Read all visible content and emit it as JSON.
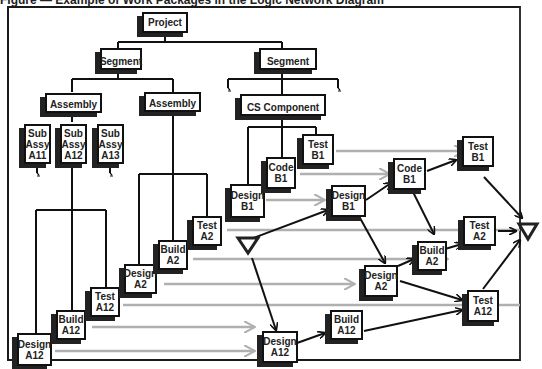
{
  "title": "Figure — Example of Work Packages in the Logic Network Diagram",
  "colors": {
    "box_border": "#111111",
    "shadow": "#222222",
    "logic_arrow": "#111111",
    "time_arrow": "#b0b0b0"
  },
  "wbs_tree": {
    "project": "Project",
    "segments": [
      "Segment",
      "Segment"
    ],
    "assemblies": [
      "Assembly",
      "Assembly"
    ],
    "cs_component": "CS Component",
    "sub_assemblies": [
      "Sub\nAssy\nA11",
      "Sub\nAssy\nA12",
      "Sub\nAssy\nA13"
    ]
  },
  "work_packages_left": {
    "a12": [
      "Design\nA12",
      "Build\nA12",
      "Test\nA12"
    ],
    "a2": [
      "Design\nA2",
      "Build\nA2",
      "Test\nA2"
    ],
    "b1": [
      "Design\nB1",
      "Code\nB1",
      "Test\nB1"
    ]
  },
  "network_nodes": {
    "design_b1": "Design\nB1",
    "code_b1": "Code\nB1",
    "test_b1": "Test\nB1",
    "design_a2": "Design\nA2",
    "build_a2": "Build\nA2",
    "test_a2": "Test\nA2",
    "design_a12": "Design\nA12",
    "build_a12": "Build\nA12",
    "test_a12": "Test\nA12"
  },
  "milestones": [
    "start-triangle",
    "end-triangle"
  ]
}
